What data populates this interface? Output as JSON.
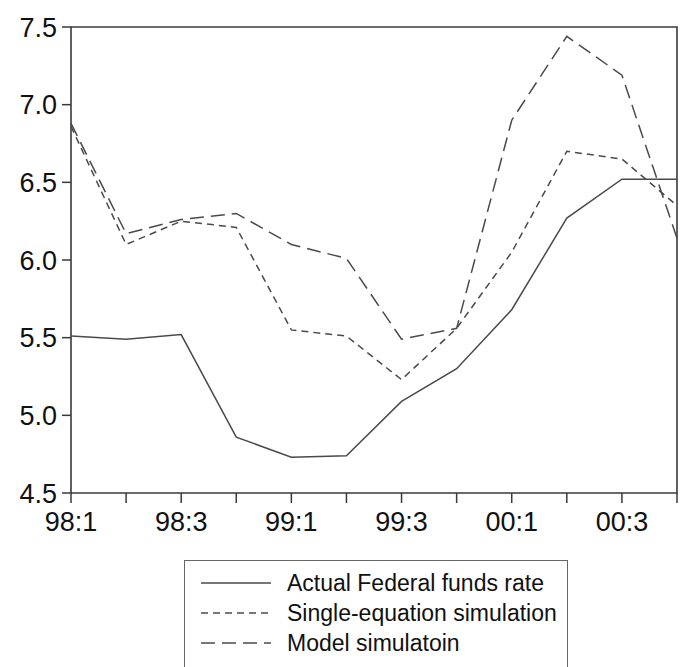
{
  "chart_data": {
    "type": "line",
    "title": "",
    "xlabel": "",
    "ylabel": "",
    "ylim": [
      4.5,
      7.5
    ],
    "yticks": [
      "4.5",
      "5.0",
      "5.5",
      "6.0",
      "6.5",
      "7.0",
      "7.5"
    ],
    "ytick_values": [
      4.5,
      5.0,
      5.5,
      6.0,
      6.5,
      7.0,
      7.5
    ],
    "grid": false,
    "legend_position": "below-center",
    "x": [
      "98:1",
      "98:2",
      "98:3",
      "98:4",
      "99:1",
      "99:2",
      "99:3",
      "99:4",
      "00:1",
      "00:2",
      "00:3",
      "00:4"
    ],
    "categories": [
      "98:1",
      "98:2",
      "98:3",
      "98:4",
      "99:1",
      "99:2",
      "99:3",
      "99:4",
      "00:1",
      "00:2",
      "00:3",
      "00:4"
    ],
    "xtick_labels_visible": [
      "98:1",
      "",
      "98:3",
      "",
      "99:1",
      "",
      "99:3",
      "",
      "00:1",
      "",
      "00:3",
      ""
    ],
    "series": [
      {
        "name": "Actual Federal funds rate",
        "style": "solid",
        "values": [
          5.51,
          5.49,
          5.52,
          4.86,
          4.73,
          4.74,
          5.09,
          5.3,
          5.68,
          6.27,
          6.52,
          6.52
        ]
      },
      {
        "name": "Single-equation simulation",
        "style": "dotted",
        "values": [
          6.86,
          6.1,
          6.25,
          6.21,
          5.55,
          5.51,
          5.23,
          5.56,
          6.05,
          6.7,
          6.65,
          6.35
        ]
      },
      {
        "name": "Model simulatoin",
        "style": "dashed",
        "values": [
          6.88,
          6.17,
          6.26,
          6.3,
          6.1,
          6.01,
          5.49,
          5.56,
          6.9,
          7.44,
          7.19,
          6.14
        ]
      }
    ]
  },
  "legend": {
    "items": [
      {
        "label": "Actual Federal funds rate",
        "style": "solid"
      },
      {
        "label": "Single-equation simulation",
        "style": "dotted"
      },
      {
        "label": "Model simulatoin",
        "style": "dashed"
      }
    ]
  },
  "colors": {
    "line": "#4a4a4a",
    "axis": "#3a3a3a",
    "text": "#111111",
    "background": "#ffffff",
    "legend_border": "#666666"
  }
}
